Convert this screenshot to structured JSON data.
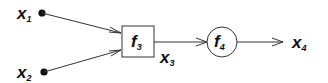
{
  "diagram": {
    "type": "computational-graph",
    "inputs": [
      {
        "id": "x1",
        "base": "x",
        "sub": "1"
      },
      {
        "id": "x2",
        "base": "x",
        "sub": "2"
      }
    ],
    "nodes": [
      {
        "id": "f3",
        "base": "f",
        "sub": "3",
        "shape": "box"
      },
      {
        "id": "f4",
        "base": "f",
        "sub": "4",
        "shape": "circle"
      }
    ],
    "intermediate": {
      "id": "x3",
      "base": "x",
      "sub": "3"
    },
    "output": {
      "id": "x4",
      "base": "x",
      "sub": "4"
    },
    "edges": [
      {
        "from": "x1",
        "to": "f3"
      },
      {
        "from": "x2",
        "to": "f3"
      },
      {
        "from": "f3",
        "to": "f4",
        "label": "x3"
      },
      {
        "from": "f4",
        "to": "x4"
      }
    ],
    "colors": {
      "stroke": "#333333",
      "text": "#111111",
      "background": "#ffffff"
    }
  }
}
